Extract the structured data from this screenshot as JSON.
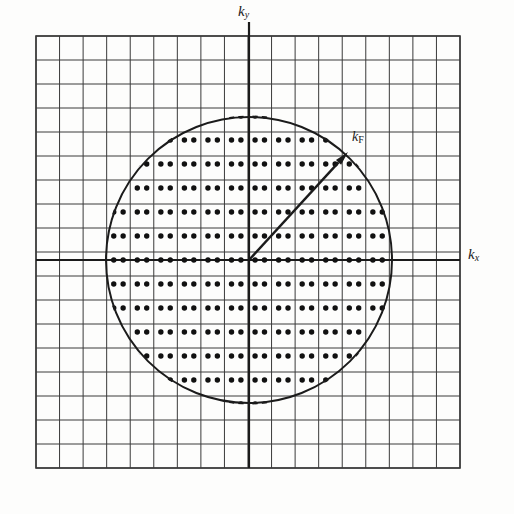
{
  "figure": {
    "background_color": "#fdfdfc",
    "ink_color": "#1b1b1b"
  },
  "axes": {
    "horizontal": {
      "name": "kx-axis",
      "label_text": "k",
      "label_sub": "x",
      "label_sub_style": "italic",
      "y_position": 260,
      "x_start": 36,
      "x_end": 460,
      "color": "#1b1b1b",
      "width": 2.2
    },
    "vertical": {
      "name": "ky-axis",
      "label_text": "k",
      "label_sub": "y",
      "label_sub_style": "italic",
      "x_position": 249,
      "y_start": 22,
      "y_end": 468,
      "color": "#1b1b1b",
      "width": 2.2
    }
  },
  "grid": {
    "name": "reciprocal-lattice-grid",
    "left": 36,
    "top": 36,
    "right": 460,
    "bottom": 468,
    "columns": 18,
    "rows": 18,
    "cell_width": 23.56,
    "cell_height": 24.0,
    "line_color": "#3a3a3a",
    "line_width": 1.0,
    "border_width": 1.6
  },
  "fermi_circle": {
    "name": "fermi-circle",
    "center_x": 249,
    "center_y": 260,
    "radius": 143,
    "stroke_color": "#1b1b1b",
    "stroke_width": 2.0,
    "fill": "none"
  },
  "fermi_vector": {
    "name": "kf-arrow",
    "label_text": "k",
    "label_sub": "F",
    "label_sub_style": "upright",
    "from_x": 249,
    "from_y": 260,
    "to_x": 348,
    "to_y": 152,
    "stroke_color": "#1b1b1b",
    "stroke_width": 2.4,
    "arrowhead_length": 14,
    "arrowhead_width": 7
  },
  "lattice_points": {
    "name": "allowed-k-states",
    "description": "Pairs of dots marking allowed k states, one pair per grid cell inside the Fermi circle",
    "dot_radius": 2.7,
    "dot_color": "#111111",
    "pair_separation": 9.4,
    "offset_x_from_cell_center": 0.0,
    "offset_y_from_cell_top": 8.0,
    "clip_to_circle": true
  },
  "labels": {
    "ky": "ky",
    "kx": "kx",
    "kf": "kF"
  }
}
